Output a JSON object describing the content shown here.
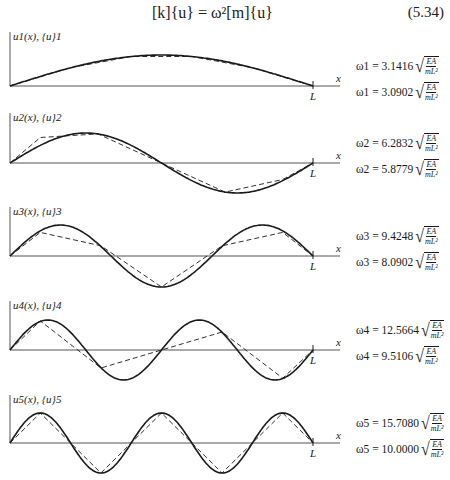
{
  "equation": {
    "text": "[k]{u} = ω²[m]{u}",
    "number": "(5.34)"
  },
  "chart_data": {
    "type": "line",
    "xlabel": "x",
    "x_end_label": "L",
    "series_styles": {
      "exact": "solid",
      "finite_element": "dashed"
    },
    "modes": [
      {
        "n": 1,
        "ylabel": "u1(x), {u}1",
        "exact_freq": "ω1 = 3.1416",
        "fe_freq": "ω1 = 3.0902",
        "exact_value": 3.1416,
        "fe_value": 3.0902,
        "factor": "√(EA/mL²)"
      },
      {
        "n": 2,
        "ylabel": "u2(x), {u}2",
        "exact_freq": "ω2 = 6.2832",
        "fe_freq": "ω2 = 5.8779",
        "exact_value": 6.2832,
        "fe_value": 5.8779,
        "factor": "√(EA/mL²)"
      },
      {
        "n": 3,
        "ylabel": "u3(x), {u}3",
        "exact_freq": "ω3 = 9.4248",
        "fe_freq": "ω3 = 8.0902",
        "exact_value": 9.4248,
        "fe_value": 8.0902,
        "factor": "√(EA/mL²)"
      },
      {
        "n": 4,
        "ylabel": "u4(x), {u}4",
        "exact_freq": "ω4 = 12.5664",
        "fe_freq": "ω4 = 9.5106",
        "exact_value": 12.5664,
        "fe_value": 9.5106,
        "factor": "√(EA/mL²)"
      },
      {
        "n": 5,
        "ylabel": "u5(x), {u}5",
        "exact_freq": "ω5 = 15.7080",
        "fe_freq": "ω5 = 10.0000",
        "exact_value": 15.708,
        "fe_value": 10.0,
        "factor": "√(EA/mL²)"
      }
    ]
  },
  "labels": {
    "x": "x",
    "L": "L",
    "num": "EA",
    "den": "mL²",
    "radical": "√"
  },
  "colors": {
    "ink": "#1a1a1a",
    "axis": "#555555"
  }
}
